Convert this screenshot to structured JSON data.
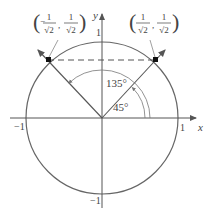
{
  "diagram": {
    "type": "unit-circle",
    "axes": {
      "x_label": "x",
      "y_label": "y"
    },
    "ticks": {
      "x_pos": "1",
      "x_neg": "−1",
      "y_pos": "1",
      "y_neg": "−1"
    },
    "angles": [
      {
        "label": "45°",
        "degrees": 45
      },
      {
        "label": "135°",
        "degrees": 135
      }
    ],
    "points": [
      {
        "name": "point-45",
        "x_num": "1",
        "x_den": "√2",
        "y_num": "1",
        "y_den": "√2",
        "x_sign": ""
      },
      {
        "name": "point-135",
        "x_num": "1",
        "x_den": "√2",
        "y_num": "1",
        "y_den": "√2",
        "x_sign": "−"
      }
    ],
    "colors": {
      "circle": "#555555",
      "axes": "#555555",
      "text": "#444444"
    }
  }
}
